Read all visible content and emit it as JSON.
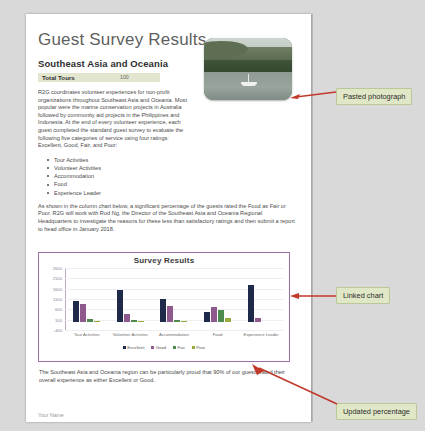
{
  "document": {
    "title": "Guest Survey Results",
    "subtitle": "Southeast Asia and Oceania",
    "total_tours_label": "Total Tours",
    "total_tours_value": "100",
    "paragraph_1": "R2G coordinates volunteer experiences for non-profit organizations throughout Southeast Asia and Oceania. Most popular were the marine conservation projects in Australia followed by community aid projects in the Philippines and Indonesia. At the end of every volunteer experience, each guest completed the standard guest survey to evaluate the following five categories of service using four ratings: Excellent, Good, Fair, and Poor:",
    "bullets": [
      "Tour Activities",
      "Volunteer Activities",
      "Accommodation",
      "Food",
      "Experience Leader"
    ],
    "paragraph_2": "As shown in the column chart below, a significant percentage of the guests rated the Food as Fair or Poor. R2G will work with Rod Ng, the Director of the Southeast Asia and Oceania Regional Headquarters to investigate the reasons for these less than satisfactory ratings and then submit a report to head office in January 2018.",
    "conclusion": "The Southeast Asia and Oceania region can be particularly proud that 90% of our guests rated their overall experience as either Excellent or Good.",
    "footer": "Your Name",
    "photo_alt": "Pasted photograph of a sailboat on a lagoon with forested hills"
  },
  "chart_data": {
    "type": "bar",
    "title": "Survey Results",
    "xlabel": "",
    "ylabel": "",
    "categories": [
      "Tour Activities",
      "Volunteer Activities",
      "Accommodation",
      "Food",
      "Experience Leader"
    ],
    "series": [
      {
        "name": "Excellent",
        "color": "#1f2a4a",
        "values": [
          1000,
          1540,
          1080,
          480,
          1780
        ]
      },
      {
        "name": "Good",
        "color": "#8e5a8e",
        "values": [
          880,
          390,
          780,
          690,
          190
        ]
      },
      {
        "name": "Fair",
        "color": "#4e8a4e",
        "values": [
          120,
          105,
          100,
          580,
          0
        ]
      },
      {
        "name": "Poor",
        "color": "#9aab3c",
        "values": [
          60,
          55,
          55,
          200,
          0
        ]
      }
    ],
    "ylim": [
      -400,
      2600
    ],
    "yticks": [
      -400,
      100,
      600,
      1100,
      1600,
      2100,
      2600
    ],
    "ytick_labels": [
      "-400",
      "100",
      "600",
      "1100",
      "1600",
      "2100",
      "2600"
    ],
    "grid": true,
    "legend_position": "bottom"
  },
  "callouts": [
    {
      "label": "Pasted photograph"
    },
    {
      "label": "Linked chart"
    },
    {
      "label": "Updated percentage"
    }
  ]
}
